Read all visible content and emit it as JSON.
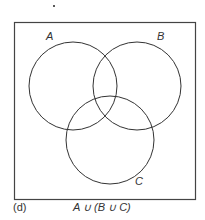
{
  "diagram": {
    "type": "venn",
    "sets": [
      {
        "label": "A",
        "cx": 73,
        "cy": 86,
        "r": 44,
        "label_x": 50,
        "label_y": 40
      },
      {
        "label": "B",
        "cx": 138,
        "cy": 86,
        "r": 44,
        "label_x": 159,
        "label_y": 40
      },
      {
        "label": "C",
        "cx": 110,
        "cy": 140,
        "r": 44,
        "label_x": 137,
        "label_y": 183
      }
    ],
    "universe_box": {
      "x": 14,
      "y": 22,
      "width": 181,
      "height": 177
    },
    "caption_label": "(d)",
    "caption_expr": "A ∪ (B ∪ C)"
  }
}
